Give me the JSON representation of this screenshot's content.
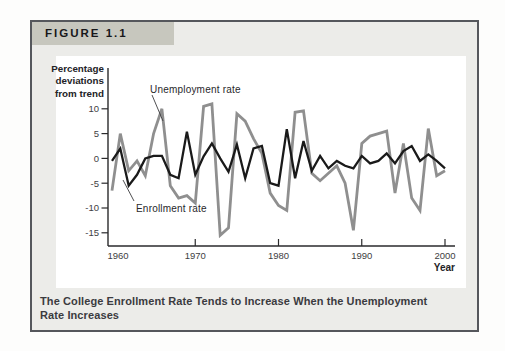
{
  "figure": {
    "tab_label": "FIGURE 1.1"
  },
  "caption": "The College Enrollment Rate Tends to Increase When the Unemployment\nRate Increases",
  "labels": {
    "y_axis": "Percentage\ndeviations\nfrom trend",
    "x_axis": "Year",
    "unemployment": "Unemployment rate",
    "enrollment": "Enrollment rate"
  },
  "colors": {
    "unemployment_line": "#8f8f8f",
    "enrollment_line": "#1a1a1a",
    "axis": "#2a2a2c",
    "tick_text": "#3e3e42",
    "tab_background": "#c7c7be",
    "box_background": "#ecece9",
    "panel_background": "#ffffff"
  },
  "chart_data": {
    "type": "line",
    "title": "",
    "xlabel": "Year",
    "ylabel": "Percentage deviations from trend",
    "xlim": [
      1960,
      2001
    ],
    "ylim": [
      -18,
      13
    ],
    "grid": false,
    "legend_position": "inline-annotations",
    "yticks": [
      10,
      5,
      0,
      -5,
      -10,
      -15
    ],
    "xticks": [
      1960,
      1970,
      1980,
      1990,
      2000
    ],
    "x": [
      1960,
      1961,
      1962,
      1963,
      1964,
      1965,
      1966,
      1967,
      1968,
      1969,
      1970,
      1971,
      1972,
      1973,
      1974,
      1975,
      1976,
      1977,
      1978,
      1979,
      1980,
      1981,
      1982,
      1983,
      1984,
      1985,
      1986,
      1987,
      1988,
      1989,
      1990,
      1991,
      1992,
      1993,
      1994,
      1995,
      1996,
      1997,
      1998,
      1999,
      2000
    ],
    "series": [
      {
        "name": "Unemployment rate",
        "color": "#8f8f8f",
        "values": [
          -6.5,
          5,
          -2.5,
          -0.5,
          -3.5,
          5,
          10,
          -5.5,
          -8,
          -7.5,
          -9,
          10.5,
          11,
          -15.5,
          -14,
          9,
          7.5,
          4,
          1,
          -7,
          -9.5,
          -10.5,
          9.3,
          9.6,
          -3,
          -4.5,
          -3,
          -1.5,
          -5,
          -14.5,
          3,
          4.5,
          5,
          5.5,
          -7,
          3,
          -8,
          -10.5,
          6,
          -3.5,
          -2.5
        ]
      },
      {
        "name": "Enrollment rate",
        "color": "#1a1a1a",
        "values": [
          -0.5,
          2,
          -5.5,
          -3.3,
          0,
          0.5,
          0.5,
          -3.3,
          -4,
          5.4,
          -3.3,
          0.4,
          3,
          0,
          -2.7,
          2.8,
          -4,
          2,
          2.5,
          -5,
          -5.5,
          5.9,
          -4,
          3.5,
          -2.5,
          0.5,
          -2,
          -0.5,
          -1.5,
          -2,
          0.5,
          -1,
          -0.5,
          1,
          -1,
          1.5,
          2.5,
          -0.5,
          0.8,
          -0.5,
          -2
        ]
      }
    ]
  }
}
